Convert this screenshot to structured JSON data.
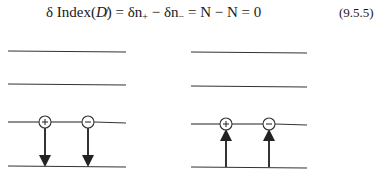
{
  "equation": {
    "delta": "δ",
    "index_label": "Index(",
    "operator": "D̸",
    "close": ")",
    "eq1": " = δn",
    "sub_plus": "+",
    "minus": " − δn",
    "sub_minus": "−",
    "rest": " = N − N = 0",
    "number": "(9.5.5)"
  },
  "figure": {
    "left_panel": {
      "levels": 4,
      "charges": [
        "+",
        "−"
      ],
      "arrow_direction": "down"
    },
    "right_panel": {
      "levels": 4,
      "charges": [
        "+",
        "−"
      ],
      "arrow_direction": "up"
    },
    "line_color": "#333333"
  }
}
